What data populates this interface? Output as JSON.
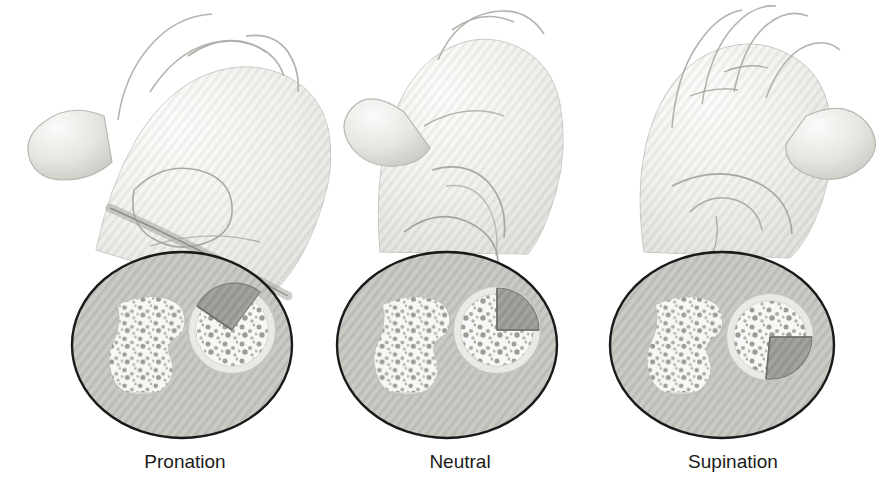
{
  "figure": {
    "background_color": "#ffffff",
    "width": 890,
    "height": 491
  },
  "palette": {
    "outline": "#1a1a1a",
    "bone_light": "#f2f2f0",
    "bone_mid": "#cfcfcb",
    "bone_shadow": "#b4b4ae",
    "tissue_fill": "#c9c9c4",
    "trabecula": "#8a8a86",
    "wedge_dark": "#9a9a95",
    "wedge_edge": "#7d7d78",
    "caption_color": "#1b1b1b"
  },
  "panels": [
    {
      "id": "pronation",
      "label": "Pronation",
      "label_x": 185,
      "label_y": 462,
      "hand_view": "dorsal-view-fist-crossed-bones",
      "ellipse": {
        "cx": 182,
        "cy": 345,
        "rx": 110,
        "ry": 93
      },
      "ulna": {
        "cx": 148,
        "cy": 350,
        "r": 48
      },
      "radius": {
        "cx": 232,
        "cy": 330,
        "r": 44
      },
      "wedge": {
        "start_deg": 195,
        "end_deg": 300,
        "description": "shaded sector on upper-left of radius"
      }
    },
    {
      "id": "neutral",
      "label": "Neutral",
      "label_x": 460,
      "label_y": 462,
      "hand_view": "lateral-edge-view-parallel-bones",
      "ellipse": {
        "cx": 447,
        "cy": 345,
        "rx": 110,
        "ry": 93
      },
      "ulna": {
        "cx": 413,
        "cy": 350,
        "r": 48
      },
      "radius": {
        "cx": 497,
        "cy": 330,
        "r": 44
      },
      "wedge": {
        "start_deg": 270,
        "end_deg": 360,
        "description": "shaded sector on upper-right quadrant of radius"
      }
    },
    {
      "id": "supination",
      "label": "Supination",
      "label_x": 733,
      "label_y": 462,
      "hand_view": "palmar-view-open-hand-parallel-bones",
      "ellipse": {
        "cx": 722,
        "cy": 345,
        "rx": 112,
        "ry": 93
      },
      "ulna": {
        "cx": 686,
        "cy": 350,
        "r": 48
      },
      "radius": {
        "cx": 770,
        "cy": 337,
        "r": 44
      },
      "wedge": {
        "start_deg": 0,
        "end_deg": 95,
        "description": "shaded sector on right and lower-right of radius"
      }
    }
  ]
}
